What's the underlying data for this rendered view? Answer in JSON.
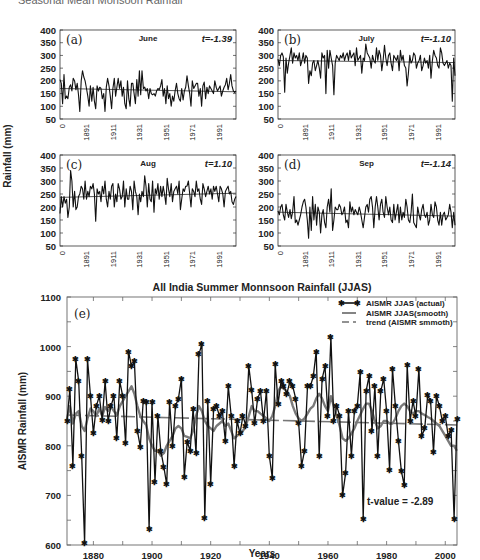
{
  "page_header": "Seasonal Mean Monsoon Rainfall",
  "chart_data": [
    {
      "id": "a",
      "type": "line",
      "panel_label": "(a)",
      "title": "June",
      "annotation": "t=-1.39",
      "ylabel": "Rainfall (mm)",
      "xlabel": "",
      "ylim": [
        50,
        400
      ],
      "yticks": [
        50,
        100,
        150,
        200,
        250,
        300,
        350,
        400
      ],
      "xticks": [
        "0",
        "1891",
        "1911",
        "1931",
        "1951",
        "1971",
        "1991"
      ],
      "x_range": [
        1871,
        2004
      ],
      "trend": [
        170,
        157
      ],
      "values": [
        205,
        190,
        110,
        225,
        130,
        140,
        130,
        175,
        185,
        160,
        210,
        200,
        165,
        190,
        145,
        80,
        200,
        240,
        215,
        200,
        170,
        140,
        100,
        180,
        120,
        175,
        120,
        90,
        180,
        160,
        175,
        170,
        130,
        150,
        80,
        175,
        210,
        180,
        140,
        90,
        170,
        210,
        140,
        175,
        210,
        170,
        200,
        140,
        175,
        110,
        90,
        200,
        130,
        100,
        190,
        190,
        150,
        110,
        205,
        140,
        240,
        145,
        240,
        170,
        175,
        160,
        170,
        130,
        170,
        150,
        145,
        150,
        140,
        160,
        170,
        165,
        180,
        205,
        140,
        170,
        110,
        180,
        130,
        150,
        100,
        140,
        120,
        160,
        190,
        150,
        130,
        120,
        170,
        125,
        160,
        175,
        220,
        180,
        150,
        100,
        200,
        170,
        180,
        190,
        190,
        140,
        170,
        100,
        180,
        195,
        130,
        175,
        150,
        180,
        170,
        160,
        150,
        200,
        175,
        160,
        170,
        180,
        140,
        160,
        175,
        185,
        210,
        165,
        190,
        225,
        180,
        160,
        155,
        160
      ]
    },
    {
      "id": "b",
      "type": "line",
      "panel_label": "(b)",
      "title": "July",
      "annotation": "t=-1.10",
      "ylabel": "",
      "xlabel": "",
      "ylim": [
        50,
        400
      ],
      "yticks": [
        50,
        100,
        150,
        200,
        250,
        300,
        350,
        400
      ],
      "xticks": [
        "0",
        "1891",
        "1911",
        "1931",
        "1951",
        "1971",
        "1991"
      ],
      "x_range": [
        1871,
        2004
      ],
      "trend": [
        280,
        272
      ],
      "values": [
        285,
        260,
        300,
        310,
        295,
        155,
        290,
        230,
        270,
        300,
        330,
        270,
        310,
        290,
        300,
        280,
        310,
        260,
        280,
        310,
        270,
        300,
        290,
        190,
        240,
        220,
        270,
        280,
        240,
        260,
        280,
        250,
        210,
        310,
        290,
        300,
        150,
        320,
        250,
        320,
        290,
        260,
        145,
        270,
        300,
        290,
        280,
        300,
        290,
        310,
        280,
        300,
        310,
        280,
        320,
        290,
        300,
        310,
        260,
        330,
        280,
        290,
        300,
        230,
        290,
        280,
        345,
        310,
        300,
        290,
        250,
        300,
        280,
        270,
        330,
        280,
        320,
        300,
        240,
        280,
        340,
        290,
        260,
        300,
        310,
        270,
        240,
        300,
        290,
        280,
        300,
        240,
        320,
        280,
        300,
        260,
        250,
        180,
        230,
        300,
        270,
        280,
        310,
        300,
        250,
        270,
        280,
        300,
        240,
        260,
        290,
        270,
        280,
        250,
        300,
        210,
        280,
        320,
        300,
        290,
        260,
        250,
        330,
        310,
        270,
        260,
        270,
        280,
        250,
        270,
        260,
        120,
        290,
        220
      ]
    },
    {
      "id": "c",
      "type": "line",
      "panel_label": "(c)",
      "title": "Aug",
      "annotation": "t=1.10",
      "ylabel": "",
      "xlabel": "",
      "ylim": [
        50,
        400
      ],
      "yticks": [
        50,
        100,
        150,
        200,
        250,
        300,
        350,
        400
      ],
      "xticks": [
        "0",
        "1891",
        "1911",
        "1931",
        "1951",
        "1971",
        "1991"
      ],
      "x_range": [
        1871,
        2004
      ],
      "trend": [
        237,
        253
      ],
      "values": [
        175,
        240,
        200,
        240,
        215,
        230,
        160,
        200,
        340,
        300,
        200,
        260,
        190,
        200,
        240,
        250,
        280,
        270,
        230,
        300,
        230,
        260,
        240,
        280,
        270,
        290,
        250,
        145,
        270,
        250,
        260,
        220,
        280,
        250,
        300,
        230,
        200,
        260,
        230,
        280,
        290,
        200,
        250,
        220,
        290,
        270,
        230,
        240,
        300,
        200,
        270,
        230,
        230,
        280,
        260,
        190,
        300,
        260,
        240,
        170,
        250,
        220,
        260,
        240,
        320,
        280,
        200,
        290,
        230,
        220,
        300,
        180,
        270,
        250,
        290,
        230,
        280,
        240,
        280,
        250,
        210,
        310,
        270,
        240,
        290,
        220,
        260,
        270,
        280,
        250,
        300,
        190,
        230,
        270,
        260,
        280,
        280,
        300,
        250,
        200,
        270,
        260,
        240,
        300,
        260,
        270,
        230,
        210,
        290,
        270,
        240,
        260,
        280,
        250,
        270,
        230,
        280,
        260,
        280,
        250,
        220,
        280,
        270,
        250,
        200,
        260,
        270,
        280,
        250,
        260,
        220,
        210,
        230,
        240
      ]
    },
    {
      "id": "d",
      "type": "line",
      "panel_label": "(d)",
      "title": "Sep",
      "annotation": "t=-1.14",
      "ylabel": "",
      "xlabel": "",
      "ylim": [
        50,
        400
      ],
      "yticks": [
        50,
        100,
        150,
        200,
        250,
        300,
        350,
        400
      ],
      "xticks": [
        "0",
        "1891",
        "1911",
        "1931",
        "1951",
        "1971",
        "1991"
      ],
      "x_range": [
        1871,
        2004
      ],
      "trend": [
        180,
        165
      ],
      "values": [
        185,
        170,
        200,
        210,
        170,
        150,
        210,
        180,
        160,
        190,
        155,
        180,
        240,
        140,
        150,
        130,
        150,
        170,
        200,
        220,
        230,
        200,
        150,
        80,
        200,
        110,
        240,
        150,
        210,
        130,
        200,
        180,
        100,
        170,
        190,
        140,
        120,
        200,
        230,
        180,
        270,
        110,
        150,
        200,
        190,
        190,
        210,
        200,
        170,
        180,
        200,
        140,
        150,
        120,
        220,
        180,
        200,
        170,
        190,
        180,
        170,
        200,
        180,
        150,
        120,
        160,
        200,
        210,
        180,
        230,
        240,
        200,
        120,
        200,
        240,
        200,
        150,
        210,
        230,
        180,
        160,
        240,
        200,
        170,
        200,
        150,
        140,
        210,
        150,
        180,
        210,
        140,
        200,
        150,
        180,
        160,
        230,
        200,
        150,
        140,
        180,
        250,
        140,
        130,
        120,
        200,
        170,
        150,
        190,
        210,
        170,
        160,
        180,
        130,
        150,
        210,
        170,
        160,
        220,
        200,
        150,
        130,
        180,
        130,
        170,
        180,
        150,
        160,
        170,
        210,
        180,
        120,
        180,
        130
      ]
    },
    {
      "id": "e",
      "type": "line",
      "panel_label": "(e)",
      "title": "All India Summer Monnsoon Rainfall (JJAS)",
      "xlabel": "Years",
      "ylabel": "AISMR Rainfall (mm)",
      "ylim": [
        600,
        1100
      ],
      "yticks": [
        600,
        700,
        800,
        900,
        1000,
        1100
      ],
      "xlim": [
        1871,
        2004
      ],
      "xticks": [
        1880,
        1900,
        1920,
        1940,
        1960,
        1980,
        2000
      ],
      "grid": false,
      "legend_position": "upper right",
      "legend": [
        {
          "label": "AISMR JJAS (actual)",
          "style": "black line with star markers"
        },
        {
          "label": "AISMR JJAS(smooth)",
          "style": "thick gray line"
        },
        {
          "label": "trend (AISMR smmoth)",
          "style": "dashed gray line"
        }
      ],
      "annotation": "t-value = -2.89",
      "trend": {
        "start": 862,
        "end": 842
      },
      "x": [
        1871,
        1872,
        1873,
        1874,
        1875,
        1876,
        1877,
        1878,
        1879,
        1880,
        1881,
        1882,
        1883,
        1884,
        1885,
        1886,
        1887,
        1888,
        1889,
        1890,
        1891,
        1892,
        1893,
        1894,
        1895,
        1896,
        1897,
        1898,
        1899,
        1900,
        1901,
        1902,
        1903,
        1904,
        1905,
        1906,
        1907,
        1908,
        1909,
        1910,
        1911,
        1912,
        1913,
        1914,
        1915,
        1916,
        1917,
        1918,
        1919,
        1920,
        1921,
        1922,
        1923,
        1924,
        1925,
        1926,
        1927,
        1928,
        1929,
        1930,
        1931,
        1932,
        1933,
        1934,
        1935,
        1936,
        1937,
        1938,
        1939,
        1940,
        1941,
        1942,
        1943,
        1944,
        1945,
        1946,
        1947,
        1948,
        1949,
        1950,
        1951,
        1952,
        1953,
        1954,
        1955,
        1956,
        1957,
        1958,
        1959,
        1960,
        1961,
        1962,
        1963,
        1964,
        1965,
        1966,
        1967,
        1968,
        1969,
        1970,
        1971,
        1972,
        1973,
        1974,
        1975,
        1976,
        1977,
        1978,
        1979,
        1980,
        1981,
        1982,
        1983,
        1984,
        1985,
        1986,
        1987,
        1988,
        1989,
        1990,
        1991,
        1992,
        1993,
        1994,
        1995,
        1996,
        1997,
        1998,
        1999,
        2000,
        2001,
        2002,
        2003,
        2004
      ],
      "series": [
        {
          "name": "AISMR JJAS (actual)",
          "values": [
            850,
            915,
            760,
            975,
            930,
            780,
            605,
            975,
            900,
            825,
            880,
            900,
            852,
            930,
            850,
            880,
            900,
            815,
            930,
            900,
            805,
            990,
            960,
            970,
            830,
            798,
            890,
            888,
            632,
            888,
            728,
            860,
            790,
            758,
            722,
            888,
            800,
            880,
            895,
            935,
            738,
            808,
            790,
            875,
            785,
            985,
            1005,
            655,
            890,
            723,
            875,
            880,
            860,
            870,
            810,
            920,
            860,
            760,
            850,
            825,
            860,
            840,
            960,
            912,
            845,
            895,
            910,
            850,
            910,
            780,
            735,
            965,
            885,
            930,
            920,
            905,
            930,
            920,
            895,
            845,
            760,
            790,
            920,
            920,
            940,
            990,
            780,
            935,
            960,
            860,
            1020,
            850,
            880,
            860,
            700,
            745,
            870,
            780,
            870,
            880,
            948,
            652,
            910,
            940,
            830,
            920,
            780,
            910,
            935,
            870,
            752,
            955,
            880,
            810,
            750,
            720,
            962,
            850,
            890,
            860,
            955,
            820,
            835,
            902,
            890,
            788,
            900,
            880,
            850,
            860,
            820,
            832,
            653,
            855
          ]
        },
        {
          "name": "AISMR JJAS(smooth)",
          "values": [
            855,
            880,
            845,
            865,
            870,
            840,
            830,
            855,
            875,
            870,
            860,
            875,
            860,
            878,
            870,
            880,
            870,
            862,
            880,
            890,
            900,
            910,
            920,
            905,
            880,
            860,
            850,
            842,
            815,
            800,
            790,
            790,
            780,
            785,
            800,
            810,
            820,
            835,
            840,
            835,
            820,
            818,
            815,
            830,
            860,
            880,
            870,
            850,
            840,
            835,
            830,
            840,
            845,
            850,
            840,
            845,
            830,
            815,
            820,
            825,
            830,
            840,
            860,
            880,
            870,
            870,
            865,
            860,
            855,
            850,
            860,
            880,
            910,
            920,
            915,
            910,
            900,
            880,
            865,
            855,
            850,
            855,
            865,
            875,
            880,
            895,
            905,
            895,
            880,
            870,
            900,
            880,
            860,
            840,
            815,
            810,
            815,
            825,
            835,
            850,
            862,
            875,
            885,
            885,
            870,
            850,
            835,
            840,
            850,
            850,
            845,
            845,
            855,
            870,
            880,
            885,
            880,
            870,
            865,
            870,
            870,
            865,
            862,
            858,
            855,
            850,
            845,
            840,
            830,
            820,
            810,
            800,
            800,
            790
          ]
        },
        {
          "name": "trend (AISMR smmoth)",
          "values": [
            862,
            842
          ]
        }
      ]
    }
  ]
}
